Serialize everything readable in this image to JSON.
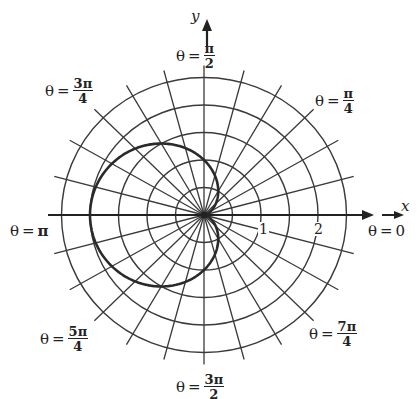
{
  "figure": {
    "type": "polar-graph",
    "curve": {
      "name": "cardioid",
      "equation": "r = 1 - cos(theta)",
      "color": "#2a2a2a"
    },
    "grid": {
      "circle_radii": [
        0.5,
        1,
        1.5,
        2,
        2.5
      ],
      "radial_step_degrees": 15,
      "color": "#3a3a3a"
    },
    "axes": {
      "x_label": "x",
      "y_label": "y"
    },
    "tick_labels": [
      {
        "text": "1",
        "r": 1
      },
      {
        "text": "2",
        "r": 2
      }
    ],
    "angle_labels": {
      "zero": {
        "theta": "θ",
        "eq": "=",
        "value": "0"
      },
      "pi": {
        "theta": "θ",
        "eq": "=",
        "value": "π"
      },
      "pi_over_2": {
        "theta": "θ",
        "eq": "=",
        "num": "π",
        "den": "2"
      },
      "pi_over_4": {
        "theta": "θ",
        "eq": "=",
        "num": "π",
        "den": "4"
      },
      "three_pi_over_4": {
        "theta": "θ",
        "eq": "=",
        "num": "3π",
        "den": "4"
      },
      "five_pi_over_4": {
        "theta": "θ",
        "eq": "=",
        "num": "5π",
        "den": "4"
      },
      "seven_pi_over_4": {
        "theta": "θ",
        "eq": "=",
        "num": "7π",
        "den": "4"
      },
      "three_pi_over_2": {
        "theta": "θ",
        "eq": "=",
        "num": "3π",
        "den": "2"
      }
    }
  }
}
